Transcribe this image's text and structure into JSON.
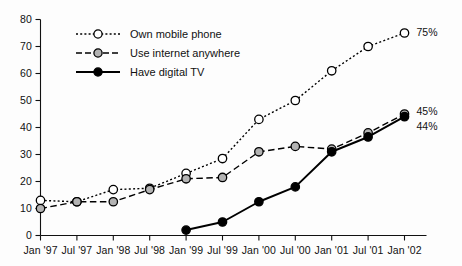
{
  "chart_data": {
    "type": "line",
    "title": "",
    "xlabel": "",
    "ylabel": "",
    "ylim": [
      0,
      80
    ],
    "ytick_step": 10,
    "grid": false,
    "legend_position": "upper-left-inside",
    "categories": [
      "Jan '97",
      "Jul '97",
      "Jan '98",
      "Jul '98",
      "Jan '99",
      "Jul '99",
      "Jan '00",
      "Jul '00",
      "Jan '01",
      "Jul '01",
      "Jan '02"
    ],
    "yticks": [
      "0",
      "10",
      "20",
      "30",
      "40",
      "50",
      "60",
      "70",
      "80"
    ],
    "series": [
      {
        "name": "Own mobile phone",
        "marker": "open-circle",
        "line_style": "dotted",
        "color": "#000000",
        "marker_fill": "#ffffff",
        "values": [
          13,
          12.5,
          17,
          17.5,
          23,
          28.5,
          43,
          50,
          61,
          70,
          75
        ],
        "end_label": "75%"
      },
      {
        "name": "Use internet anywhere",
        "marker": "gray-circle",
        "line_style": "dashed",
        "color": "#000000",
        "marker_fill": "#b3b3b3",
        "values": [
          10,
          12.5,
          12.5,
          17,
          21,
          21.5,
          31,
          33,
          32,
          38,
          45
        ],
        "end_label": "45%"
      },
      {
        "name": "Have digital TV",
        "marker": "filled-circle",
        "line_style": "solid",
        "color": "#000000",
        "marker_fill": "#000000",
        "values": [
          null,
          null,
          null,
          null,
          2,
          5,
          12.5,
          18,
          31,
          36.5,
          44
        ],
        "end_label": "44%"
      }
    ]
  },
  "legend": {
    "items": [
      {
        "label": "Own mobile phone"
      },
      {
        "label": "Use internet anywhere"
      },
      {
        "label": "Have digital TV"
      }
    ]
  },
  "end_labels": {
    "mobile": "75%",
    "internet": "45%",
    "tv": "44%"
  }
}
